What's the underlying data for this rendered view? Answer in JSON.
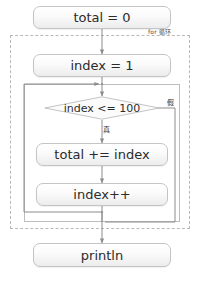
{
  "diagram": {
    "type": "flowchart",
    "nodes": [
      {
        "id": "init-total",
        "shape": "process",
        "text": "total = 0"
      },
      {
        "id": "init-index",
        "shape": "process",
        "text": "index = 1"
      },
      {
        "id": "condition",
        "shape": "decision",
        "text": "index <= 100"
      },
      {
        "id": "accumulate",
        "shape": "process",
        "text": "total += index"
      },
      {
        "id": "increment",
        "shape": "process",
        "text": "index++"
      },
      {
        "id": "output",
        "shape": "process",
        "text": "println"
      }
    ],
    "containers": [
      {
        "id": "for-loop-group",
        "label": "for 循环",
        "style": "dashed"
      },
      {
        "id": "loop-body-group",
        "label": "",
        "style": "solid"
      }
    ],
    "edge_labels": {
      "true_branch": "真",
      "false_branch": "假"
    },
    "colors": {
      "node_border": "#c4c4c4",
      "node_fill_top": "#ffffff",
      "node_fill_bottom": "#ececec",
      "edge": "#8c8c8c",
      "dashed_container": "#b9b9b9",
      "solid_container": "#bdbdbd",
      "text": "#2b2b2b"
    }
  }
}
